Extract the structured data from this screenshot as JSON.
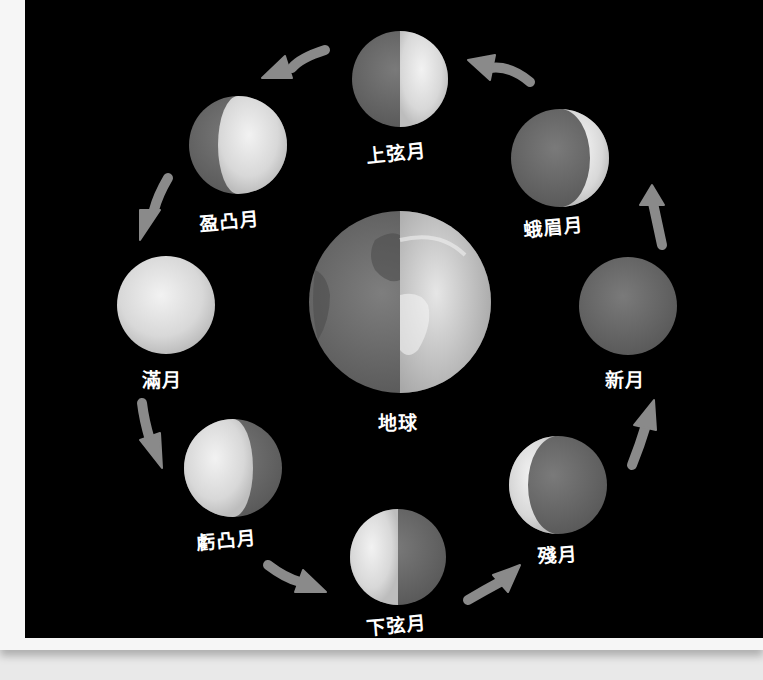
{
  "diagram": {
    "center": {
      "label": "地球",
      "name": "earth"
    },
    "phases": [
      {
        "id": "new-moon",
        "label": "新月"
      },
      {
        "id": "waxing-crescent",
        "label": "蛾眉月"
      },
      {
        "id": "first-quarter",
        "label": "上弦月"
      },
      {
        "id": "waxing-gibbous",
        "label": "盈凸月"
      },
      {
        "id": "full-moon",
        "label": "滿月"
      },
      {
        "id": "waning-gibbous",
        "label": "虧凸月"
      },
      {
        "id": "last-quarter",
        "label": "下弦月"
      },
      {
        "id": "waning-crescent",
        "label": "殘月"
      }
    ],
    "arrow_direction": "counter-clockwise",
    "colors": {
      "background": "#000000",
      "moon_light": "#e2e2e2",
      "moon_dark": "#6e6e6e",
      "arrow": "#8a8a8a",
      "label": "#ffffff",
      "paper": "#f6f6f6"
    }
  }
}
